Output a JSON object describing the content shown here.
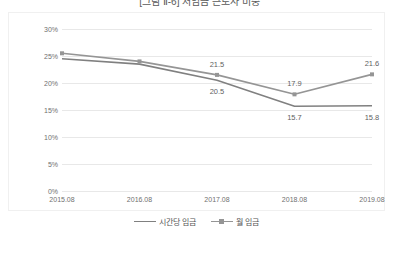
{
  "chart_data": {
    "type": "line",
    "title": "[그림 Ⅱ-6] 저임금 근로자 비중",
    "xlabel": "",
    "ylabel": "",
    "categories": [
      "2015.08",
      "2016.08",
      "2017.08",
      "2018.08",
      "2019.08"
    ],
    "ylim": [
      0,
      30
    ],
    "ytick_labels": [
      "0%",
      "5%",
      "10%",
      "15%",
      "20%",
      "25%",
      "30%"
    ],
    "ytick_values": [
      0,
      5,
      10,
      15,
      20,
      25,
      30
    ],
    "grid": true,
    "legend_position": "bottom",
    "series": [
      {
        "name": "시간당 임금",
        "color": "#808080",
        "marker": "none",
        "values": [
          24.5,
          23.5,
          20.5,
          15.7,
          15.8
        ],
        "labels": [
          "",
          "",
          "20.5",
          "15.7",
          "15.8"
        ],
        "label_positions": [
          "below",
          "below",
          "below",
          "below",
          "below"
        ]
      },
      {
        "name": "월 임금",
        "color": "#959595",
        "marker": "square",
        "values": [
          25.5,
          24.0,
          21.5,
          17.9,
          21.6
        ],
        "labels": [
          "",
          "",
          "21.5",
          "17.9",
          "21.6"
        ],
        "label_positions": [
          "above",
          "above",
          "above",
          "above",
          "above"
        ]
      }
    ]
  },
  "legend": {
    "entries": [
      {
        "label": "시간당 임금"
      },
      {
        "label": "월 임금"
      }
    ]
  }
}
